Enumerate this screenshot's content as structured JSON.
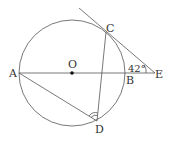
{
  "diagram": {
    "type": "geometry",
    "circle": {
      "center": "O",
      "cx": 72,
      "cy": 73,
      "r": 53
    },
    "points": {
      "A": {
        "label": "A",
        "x": 19,
        "y": 73
      },
      "O": {
        "label": "O",
        "x": 72,
        "y": 73
      },
      "B": {
        "label": "B",
        "x": 125,
        "y": 73
      },
      "E": {
        "label": "E",
        "x": 153,
        "y": 73
      },
      "C": {
        "label": "C",
        "x": 106,
        "y": 32
      },
      "D": {
        "label": "D",
        "x": 97,
        "y": 121
      }
    },
    "segments": [
      "AE",
      "AD",
      "CD",
      "CE tangent"
    ],
    "angle_E": {
      "label": "42°",
      "value": 42
    },
    "angle_D_marked": true,
    "colors": {
      "stroke": "#555555",
      "text": "#333333"
    }
  }
}
